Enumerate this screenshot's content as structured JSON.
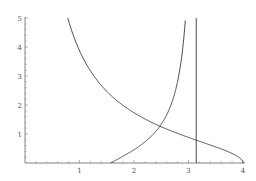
{
  "chart_data": {
    "type": "line",
    "title": "",
    "xlabel": "",
    "ylabel": "",
    "xlim": [
      0,
      4
    ],
    "ylim": [
      0,
      5
    ],
    "grid": false,
    "legend": null,
    "x_ticks": [
      1,
      2,
      3,
      4
    ],
    "y_ticks": [
      1,
      2,
      3,
      4,
      5
    ],
    "x_tick_labels": [
      "1",
      "2",
      "3",
      "4"
    ],
    "y_tick_labels": [
      "1",
      "2",
      "3",
      "4",
      "5"
    ],
    "series": [
      {
        "name": "decreasing curve (y = sqrt(16 - x^2)/x)",
        "points": [
          [
            0.78,
            5.0
          ],
          [
            1.0,
            3.87
          ],
          [
            1.5,
            2.47
          ],
          [
            2.0,
            1.73
          ],
          [
            2.46,
            1.28
          ],
          [
            3.0,
            0.88
          ],
          [
            3.14,
            0.79
          ],
          [
            3.5,
            0.55
          ],
          [
            3.9,
            0.23
          ],
          [
            4.0,
            0.0
          ]
        ]
      },
      {
        "name": "increasing curve (y = -cot x)",
        "points": [
          [
            1.57,
            0.0
          ],
          [
            1.8,
            0.23
          ],
          [
            2.0,
            0.46
          ],
          [
            2.2,
            0.73
          ],
          [
            2.46,
            1.27
          ],
          [
            2.6,
            1.67
          ],
          [
            2.75,
            2.61
          ],
          [
            2.85,
            3.44
          ],
          [
            2.94,
            4.98
          ]
        ]
      },
      {
        "name": "vertical line x = pi",
        "points": [
          [
            3.14159,
            0.0
          ],
          [
            3.14159,
            5.0
          ]
        ]
      }
    ]
  },
  "colors": {
    "curve": "#333333",
    "axis": "#666666",
    "tick_label": "#555555"
  }
}
